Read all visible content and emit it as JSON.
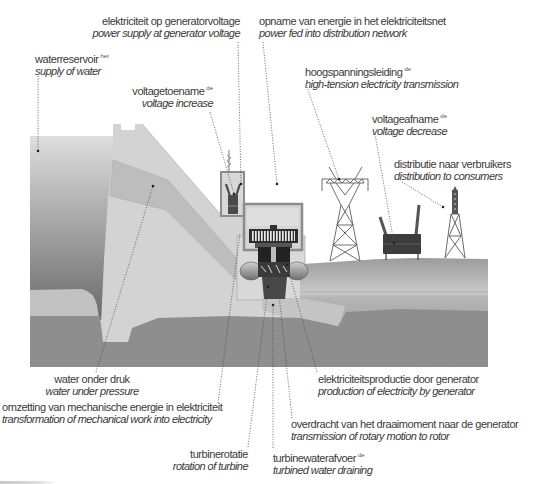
{
  "labels": {
    "generator_voltage": {
      "nl": "elektriciteit op generatorvoltage",
      "en": "power supply at generator voltage"
    },
    "power_fed": {
      "nl": "opname van energie in het elektriciteitsnet",
      "en": "power fed into distribution network"
    },
    "waterreservoir": {
      "nl": "waterreservoir",
      "sup": "het",
      "en": "supply of water"
    },
    "voltage_increase": {
      "nl": "voltagetoename",
      "sup": "de",
      "en": "voltage increase"
    },
    "high_tension": {
      "nl": "hoogspanningsleiding",
      "sup": "de",
      "en": "high-tension electricity transmission"
    },
    "voltage_decrease": {
      "nl": "voltageafname",
      "sup": "de",
      "en": "voltage decrease"
    },
    "distribution": {
      "nl": "distributie naar verbruikers",
      "en": "distribution to consumers"
    },
    "water_pressure": {
      "nl": "water onder druk",
      "en": "water under pressure"
    },
    "transformation": {
      "nl": "omzetting van mechanische energie in elektriciteit",
      "en": "transformation of mechanical work into electricity"
    },
    "turbine_rotation": {
      "nl": "turbinerotatie",
      "en": "rotation of turbine"
    },
    "electricity_production": {
      "nl": "elektriciteitsproductie door generator",
      "en": "production of electricity by generator"
    },
    "rotary_transmission": {
      "nl": "overdracht van het draaimoment naar de generator",
      "en": "transmission of rotary motion to rotor"
    },
    "water_draining": {
      "nl": "turbinewaterafvoer",
      "sup": "de",
      "en": "turbined water draining"
    }
  },
  "colors": {
    "text": "#3a3a3a",
    "dam": "#d3d3d3",
    "penstock": "#bdbdbd",
    "ground_dark": "#8e8e8e",
    "reservoir_top": "#dcdcdc",
    "reservoir_bottom": "#6a6a6a",
    "structure_outline": "#8c8c8c",
    "machinery": "#2e2e2e"
  }
}
